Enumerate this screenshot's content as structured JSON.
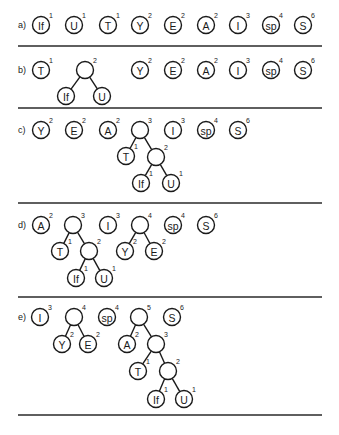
{
  "radius": 8.5,
  "steps": [
    {
      "label": "a)",
      "label_pos": [
        18,
        25
      ],
      "separator_y": 46,
      "nodes": [
        {
          "id": "If",
          "text": "If",
          "weight": "1",
          "x": 41,
          "y": 25
        },
        {
          "id": "U",
          "text": "U",
          "weight": "1",
          "x": 74,
          "y": 25
        },
        {
          "id": "T",
          "text": "T",
          "weight": "1",
          "x": 108,
          "y": 25
        },
        {
          "id": "Y",
          "text": "Y",
          "weight": "2",
          "x": 140,
          "y": 25
        },
        {
          "id": "E",
          "text": "E",
          "weight": "2",
          "x": 173,
          "y": 25
        },
        {
          "id": "A",
          "text": "A",
          "weight": "2",
          "x": 206,
          "y": 25
        },
        {
          "id": "I",
          "text": "I",
          "weight": "3",
          "x": 238,
          "y": 25
        },
        {
          "id": "sp",
          "text": "sp",
          "weight": "4",
          "x": 271,
          "y": 25
        },
        {
          "id": "S",
          "text": "S",
          "weight": "6",
          "x": 303,
          "y": 25
        }
      ],
      "edges": []
    },
    {
      "label": "b)",
      "label_pos": [
        18,
        70
      ],
      "separator_y": 108,
      "nodes": [
        {
          "id": "T",
          "text": "T",
          "weight": "1",
          "x": 41,
          "y": 70
        },
        {
          "id": "n1",
          "text": "",
          "weight": "2",
          "x": 85,
          "y": 70
        },
        {
          "id": "If",
          "text": "If",
          "weight": "",
          "x": 66,
          "y": 96
        },
        {
          "id": "U",
          "text": "U",
          "weight": "",
          "x": 102,
          "y": 96
        },
        {
          "id": "Y",
          "text": "Y",
          "weight": "2",
          "x": 140,
          "y": 70
        },
        {
          "id": "E",
          "text": "E",
          "weight": "2",
          "x": 173,
          "y": 70
        },
        {
          "id": "A",
          "text": "A",
          "weight": "2",
          "x": 206,
          "y": 70
        },
        {
          "id": "I",
          "text": "I",
          "weight": "3",
          "x": 238,
          "y": 70
        },
        {
          "id": "sp",
          "text": "sp",
          "weight": "4",
          "x": 271,
          "y": 70
        },
        {
          "id": "S",
          "text": "S",
          "weight": "6",
          "x": 303,
          "y": 70
        }
      ],
      "edges": [
        [
          "n1",
          "If"
        ],
        [
          "n1",
          "U"
        ]
      ]
    },
    {
      "label": "c)",
      "label_pos": [
        18,
        130
      ],
      "separator_y": 203,
      "nodes": [
        {
          "id": "Y",
          "text": "Y",
          "weight": "2",
          "x": 41,
          "y": 130
        },
        {
          "id": "E",
          "text": "E",
          "weight": "2",
          "x": 74,
          "y": 130
        },
        {
          "id": "A",
          "text": "A",
          "weight": "2",
          "x": 108,
          "y": 130
        },
        {
          "id": "n2",
          "text": "",
          "weight": "3",
          "x": 140,
          "y": 130
        },
        {
          "id": "I",
          "text": "I",
          "weight": "3",
          "x": 173,
          "y": 130
        },
        {
          "id": "sp",
          "text": "sp",
          "weight": "4",
          "x": 206,
          "y": 130
        },
        {
          "id": "S",
          "text": "S",
          "weight": "6",
          "x": 238,
          "y": 130
        },
        {
          "id": "T",
          "text": "T",
          "weight": "1",
          "x": 126,
          "y": 156
        },
        {
          "id": "n1",
          "text": "",
          "weight": "2",
          "x": 156,
          "y": 157
        },
        {
          "id": "If",
          "text": "If",
          "weight": "1",
          "x": 141,
          "y": 183
        },
        {
          "id": "U",
          "text": "U",
          "weight": "1",
          "x": 171,
          "y": 183
        }
      ],
      "edges": [
        [
          "n2",
          "T"
        ],
        [
          "n2",
          "n1"
        ],
        [
          "n1",
          "If"
        ],
        [
          "n1",
          "U"
        ]
      ]
    },
    {
      "label": "d)",
      "label_pos": [
        18,
        225
      ],
      "separator_y": 297,
      "nodes": [
        {
          "id": "A",
          "text": "A",
          "weight": "2",
          "x": 41,
          "y": 225
        },
        {
          "id": "n2",
          "text": "",
          "weight": "3",
          "x": 73,
          "y": 225
        },
        {
          "id": "I",
          "text": "I",
          "weight": "3",
          "x": 108,
          "y": 225
        },
        {
          "id": "n3",
          "text": "",
          "weight": "4",
          "x": 140,
          "y": 225
        },
        {
          "id": "sp",
          "text": "sp",
          "weight": "4",
          "x": 173,
          "y": 225
        },
        {
          "id": "S",
          "text": "S",
          "weight": "6",
          "x": 206,
          "y": 225
        },
        {
          "id": "T",
          "text": "T",
          "weight": "1",
          "x": 60,
          "y": 251
        },
        {
          "id": "n1",
          "text": "",
          "weight": "2",
          "x": 89,
          "y": 251
        },
        {
          "id": "If",
          "text": "If",
          "weight": "1",
          "x": 76,
          "y": 278
        },
        {
          "id": "U",
          "text": "U",
          "weight": "1",
          "x": 104,
          "y": 278
        },
        {
          "id": "Y",
          "text": "Y",
          "weight": "2",
          "x": 125,
          "y": 251
        },
        {
          "id": "E",
          "text": "E",
          "weight": "2",
          "x": 154,
          "y": 251
        }
      ],
      "edges": [
        [
          "n2",
          "T"
        ],
        [
          "n2",
          "n1"
        ],
        [
          "n1",
          "If"
        ],
        [
          "n1",
          "U"
        ],
        [
          "n3",
          "Y"
        ],
        [
          "n3",
          "E"
        ]
      ]
    },
    {
      "label": "e)",
      "label_pos": [
        18,
        317
      ],
      "separator_y": 415,
      "nodes": [
        {
          "id": "I",
          "text": "I",
          "weight": "3",
          "x": 40,
          "y": 317
        },
        {
          "id": "n3",
          "text": "",
          "weight": "4",
          "x": 74,
          "y": 317
        },
        {
          "id": "sp",
          "text": "sp",
          "weight": "4",
          "x": 107,
          "y": 317
        },
        {
          "id": "n4",
          "text": "",
          "weight": "5",
          "x": 139,
          "y": 317
        },
        {
          "id": "S",
          "text": "S",
          "weight": "6",
          "x": 172,
          "y": 317
        },
        {
          "id": "Y",
          "text": "Y",
          "weight": "2",
          "x": 62,
          "y": 344
        },
        {
          "id": "E",
          "text": "E",
          "weight": "2",
          "x": 88,
          "y": 344
        },
        {
          "id": "A",
          "text": "A",
          "weight": "2",
          "x": 127,
          "y": 344
        },
        {
          "id": "n2",
          "text": "",
          "weight": "3",
          "x": 156,
          "y": 344
        },
        {
          "id": "T",
          "text": "T",
          "weight": "1",
          "x": 138,
          "y": 371
        },
        {
          "id": "n1",
          "text": "",
          "weight": "2",
          "x": 168,
          "y": 371
        },
        {
          "id": "If",
          "text": "If",
          "weight": "1",
          "x": 156,
          "y": 399
        },
        {
          "id": "U",
          "text": "U",
          "weight": "1",
          "x": 184,
          "y": 399
        }
      ],
      "edges": [
        [
          "n3",
          "Y"
        ],
        [
          "n3",
          "E"
        ],
        [
          "n4",
          "A"
        ],
        [
          "n4",
          "n2"
        ],
        [
          "n2",
          "T"
        ],
        [
          "n2",
          "n1"
        ],
        [
          "n1",
          "If"
        ],
        [
          "n1",
          "U"
        ]
      ]
    }
  ],
  "separator_x": [
    18,
    322
  ]
}
